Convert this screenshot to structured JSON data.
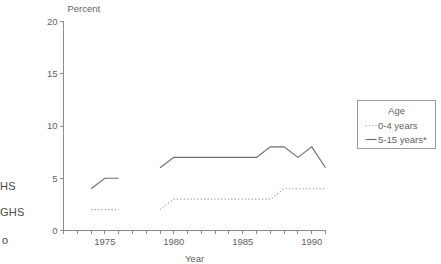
{
  "clipped_margin_text": {
    "line1": "HS",
    "line2": "GHS",
    "line3": "o"
  },
  "legend": {
    "title": "Age",
    "entries": [
      {
        "label": "0-4 years",
        "style": "dotted",
        "color": "#9a9a9a"
      },
      {
        "label": "5-15 years*",
        "style": "solid",
        "color": "#6b6b6b"
      }
    ]
  },
  "axes": {
    "y_title": "Percent",
    "x_title": "Year",
    "y_ticks": [
      "0",
      "5",
      "10",
      "15",
      "20"
    ],
    "x_ticks": [
      "1975",
      "1980",
      "1985",
      "1990"
    ]
  },
  "chart_data": {
    "type": "line",
    "title": "",
    "xlabel": "Year",
    "ylabel": "Percent",
    "xlim": [
      1972,
      1991
    ],
    "ylim": [
      0,
      20
    ],
    "grid": false,
    "legend_position": "right",
    "legend_title": "Age",
    "series": [
      {
        "name": "0-4 years",
        "style": "dotted",
        "color": "#9a9a9a",
        "segments": [
          {
            "x": [
              1974,
              1975,
              1976
            ],
            "y": [
              2,
              2,
              2
            ]
          },
          {
            "x": [
              1979,
              1980,
              1981,
              1982,
              1983,
              1984,
              1985,
              1986,
              1987,
              1988,
              1989,
              1990,
              1991
            ],
            "y": [
              2,
              3,
              3,
              3,
              3,
              3,
              3,
              3,
              3,
              4,
              4,
              4,
              4
            ]
          }
        ]
      },
      {
        "name": "5-15 years*",
        "style": "solid",
        "color": "#6b6b6b",
        "segments": [
          {
            "x": [
              1974,
              1975,
              1976
            ],
            "y": [
              4,
              5,
              5
            ]
          },
          {
            "x": [
              1979,
              1980,
              1981,
              1982,
              1983,
              1984,
              1985,
              1986,
              1987,
              1988,
              1989,
              1990,
              1991
            ],
            "y": [
              6,
              7,
              7,
              7,
              7,
              7,
              7,
              7,
              8,
              8,
              7,
              8,
              6
            ]
          }
        ]
      }
    ]
  }
}
